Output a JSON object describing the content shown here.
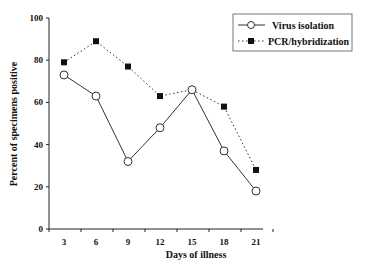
{
  "chart_data": {
    "type": "line",
    "title": "",
    "xlabel": "Days of illness",
    "ylabel": "Percent of specimens positive",
    "x": [
      3,
      6,
      9,
      12,
      15,
      18,
      21
    ],
    "categories": [
      "3",
      "6",
      "9",
      "12",
      "15",
      "18",
      "21"
    ],
    "ylim": [
      0,
      100
    ],
    "yticks": [
      0,
      20,
      40,
      60,
      80,
      100
    ],
    "grid": false,
    "legend_position": "top-right",
    "series": [
      {
        "name": "Virus isolation",
        "marker": "open-circle",
        "line": "solid",
        "values": [
          73,
          63,
          32,
          48,
          66,
          37,
          18
        ]
      },
      {
        "name": "PCR/hybridization",
        "marker": "filled-square",
        "line": "dotted",
        "values": [
          79,
          89,
          77,
          63,
          66,
          58,
          28
        ]
      }
    ]
  },
  "colors": {
    "axis": "#222222",
    "series_line": "#333333",
    "marker_fill_pcr": "#111111",
    "marker_fill_virus": "#ffffff"
  }
}
